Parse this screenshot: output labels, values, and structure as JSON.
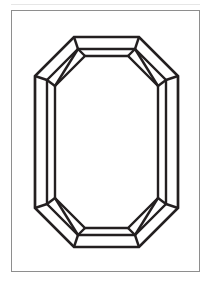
{
  "page": {
    "background_color": "#ffffff",
    "width": 211,
    "height": 289
  },
  "figure": {
    "frame": {
      "border_color": "#8e8e8e",
      "fill_color": "#ffffff",
      "x": 11,
      "y": 10,
      "width": 189,
      "height": 262
    },
    "top_rule_color": "#e6e6e6",
    "caption": "",
    "caption_color": "#f2f2f2"
  },
  "diagram": {
    "view": "face-up / table view",
    "style": "black line art on white, no fill",
    "line_color": "#231f20",
    "fill_color": "#ffffff",
    "stroke_width_outer": 2.6,
    "stroke_width_inner": 2.2,
    "parts": [
      {
        "name": "girdle-outline",
        "description": "outer octagonal girdle outline of the emerald cut"
      },
      {
        "name": "crown-step-outline",
        "description": "second octagonal step facet inside the girdle"
      },
      {
        "name": "table-facet",
        "description": "innermost large flat octagonal table facet"
      },
      {
        "name": "corner-facet-top-left",
        "description": "kite-shaped corner facet, upper left"
      },
      {
        "name": "corner-facet-top-right",
        "description": "kite-shaped corner facet, upper right"
      },
      {
        "name": "corner-facet-bottom-left",
        "description": "kite-shaped corner facet, lower left"
      },
      {
        "name": "corner-facet-bottom-right",
        "description": "kite-shaped corner facet, lower right"
      }
    ],
    "geometry": {
      "units": "svg user units within 189x262 frame",
      "girdle_octagon": "M 96,25 L 145,25 L 174,60 L 174,203 L 145,239 L 96,239 L 52,239 L 23,203 L 23,60 L 52,25 Z",
      "note": "outline is an octagon with cut corners; all facet rings are concentric and mirror-symmetric on both axes"
    }
  }
}
